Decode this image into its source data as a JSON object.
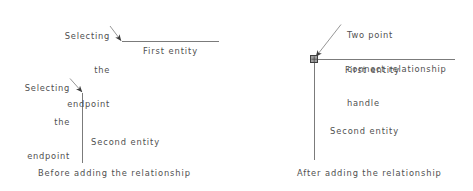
{
  "figure": {
    "line_color": "#7b7b7b",
    "text_color": "#4f4f4f",
    "background": "#ffffff",
    "handle_fill": "#9a9a9a",
    "handle_stroke": "#4a4a4a"
  },
  "panels": [
    {
      "id": "before",
      "caption": "Before adding the relationship",
      "annotations": [
        {
          "id": "first-entity-endpoint",
          "lines": [
            "Selecting",
            "the",
            "endpoint"
          ],
          "text": "Selecting the endpoint"
        },
        {
          "id": "second-entity-endpoint",
          "lines": [
            "Selecting",
            "the",
            "endpoint"
          ],
          "text": "Selecting the endpoint"
        }
      ],
      "entities": [
        {
          "id": "first-entity",
          "label": "First entity"
        },
        {
          "id": "second-entity",
          "label": "Second entity"
        }
      ]
    },
    {
      "id": "after",
      "caption": "After adding the relationship",
      "annotations": [
        {
          "id": "connect-handle",
          "lines": [
            "Two point",
            "connect relationship",
            "handle"
          ],
          "text": "Two point connect relationship handle"
        }
      ],
      "entities": [
        {
          "id": "first-entity",
          "label": "First entity"
        },
        {
          "id": "second-entity",
          "label": "Second entity"
        }
      ]
    }
  ]
}
